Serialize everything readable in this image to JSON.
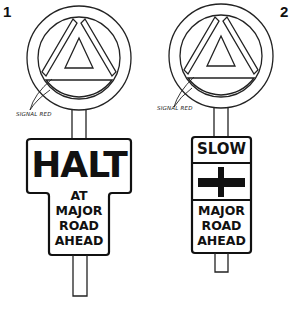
{
  "figures": [
    {
      "number": "1",
      "annotation": "SIGNAL RED",
      "plate": {
        "main_text": "HALT",
        "sub_lines": [
          "AT",
          "MAJOR",
          "ROAD",
          "AHEAD"
        ]
      }
    },
    {
      "number": "2",
      "annotation": "SIGNAL RED",
      "plate": {
        "top_text": "SLOW",
        "middle_symbol": "crossroads-symbol",
        "bottom_lines": [
          "MAJOR",
          "ROAD",
          "AHEAD"
        ]
      }
    }
  ],
  "colors": {
    "ink": "#111111",
    "background": "#ffffff"
  }
}
